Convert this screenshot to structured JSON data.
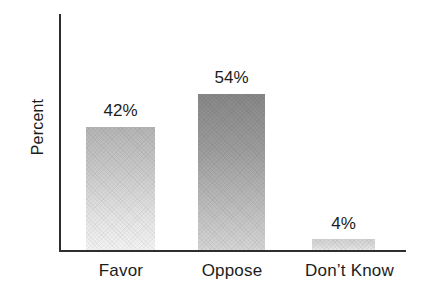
{
  "chart_data": {
    "type": "bar",
    "title": "",
    "subtitle": "",
    "xlabel": "",
    "ylabel": "Percent",
    "categories": [
      "Favor",
      "Oppose",
      "Don’t Know"
    ],
    "values": [
      42,
      54,
      4
    ],
    "value_labels": [
      "42%",
      "54%",
      "4%"
    ],
    "ylim": [
      0,
      82
    ],
    "grid": false,
    "legend": "none",
    "y_tick_labels": [],
    "x_tick_labels": [
      "Favor",
      "Oppose",
      "Don’t Know"
    ],
    "series": [
      {
        "name": "Percent",
        "values": [
          42,
          54,
          4
        ]
      }
    ],
    "bar_styles": [
      {
        "category": "Favor",
        "fill_top": "#b5b5b5",
        "fill_bottom": "#f4f4f4"
      },
      {
        "category": "Oppose",
        "fill_top": "#888888",
        "fill_bottom": "#d6d6d6"
      },
      {
        "category": "Don’t Know",
        "fill_top": "#d2d2d2",
        "fill_bottom": "#e8e8e8"
      }
    ],
    "colors": {
      "axis": "#2e2e2e",
      "text": "#1c1c1c",
      "background": "#ffffff"
    }
  },
  "axes": {
    "y_title": "Percent"
  },
  "labels": {
    "value_favor": "42%",
    "value_oppose": "54%",
    "value_dontknow": "4%",
    "tick_favor": "Favor",
    "tick_oppose": "Oppose",
    "tick_dontknow": "Don’t Know"
  }
}
